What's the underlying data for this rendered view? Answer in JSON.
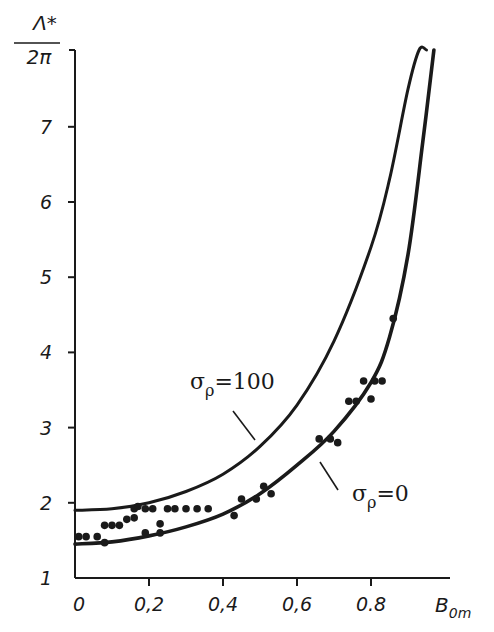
{
  "chart_data": {
    "type": "scatter",
    "title": "",
    "ylabel": "Λ* / 2π",
    "ylabel_numerator": "Λ*",
    "ylabel_denominator": "2π",
    "xlabel": "B0m",
    "xlabel_main": "B",
    "xlabel_sub": "0m",
    "xlim": [
      0,
      1.0
    ],
    "ylim": [
      1,
      8
    ],
    "x_ticks": [
      0,
      0.2,
      0.4,
      0.6,
      0.8
    ],
    "x_tick_labels": [
      "0",
      "0,2",
      "0,4",
      "0,6",
      "0.8"
    ],
    "y_ticks": [
      1,
      2,
      3,
      4,
      5,
      6,
      7
    ],
    "y_tick_labels": [
      "1",
      "2",
      "3",
      "4",
      "5",
      "6",
      "7"
    ],
    "grid": false,
    "legend": null,
    "series": [
      {
        "name": "σρ=100",
        "kind": "line",
        "label_main": "σ",
        "label_sub": "ρ",
        "label_value": "=100",
        "x": [
          0,
          0.1,
          0.2,
          0.3,
          0.4,
          0.5,
          0.6,
          0.7,
          0.8,
          0.85,
          0.9,
          0.93,
          0.95
        ],
        "y": [
          1.9,
          1.92,
          2.0,
          2.15,
          2.38,
          2.75,
          3.3,
          4.15,
          5.4,
          6.3,
          7.5,
          8.2,
          8.8
        ]
      },
      {
        "name": "σρ=0",
        "kind": "line",
        "label_main": "σ",
        "label_sub": "ρ",
        "label_value": "=0",
        "x": [
          0,
          0.1,
          0.2,
          0.3,
          0.4,
          0.5,
          0.6,
          0.7,
          0.8,
          0.85,
          0.9,
          0.94,
          0.97
        ],
        "y": [
          1.45,
          1.48,
          1.56,
          1.68,
          1.85,
          2.12,
          2.5,
          2.95,
          3.6,
          4.2,
          5.3,
          6.8,
          8.8
        ]
      },
      {
        "name": "experimental",
        "kind": "scatter",
        "x": [
          0.01,
          0.03,
          0.06,
          0.08,
          0.08,
          0.1,
          0.12,
          0.14,
          0.16,
          0.16,
          0.17,
          0.19,
          0.19,
          0.21,
          0.23,
          0.23,
          0.25,
          0.27,
          0.3,
          0.33,
          0.36,
          0.43,
          0.45,
          0.49,
          0.51,
          0.53,
          0.66,
          0.69,
          0.71,
          0.74,
          0.76,
          0.78,
          0.8,
          0.81,
          0.83,
          0.86
        ],
        "y": [
          1.55,
          1.55,
          1.55,
          1.47,
          1.7,
          1.7,
          1.7,
          1.78,
          1.92,
          1.8,
          1.95,
          1.6,
          1.92,
          1.92,
          1.72,
          1.6,
          1.92,
          1.92,
          1.92,
          1.92,
          1.92,
          1.83,
          2.05,
          2.05,
          2.22,
          2.12,
          2.85,
          2.85,
          2.8,
          3.35,
          3.35,
          3.62,
          3.38,
          3.62,
          3.62,
          4.45
        ]
      }
    ],
    "annotations": [
      {
        "text": "σρ=100",
        "points_to": "upper curve"
      },
      {
        "text": "σρ=0",
        "points_to": "lower curve"
      }
    ]
  }
}
